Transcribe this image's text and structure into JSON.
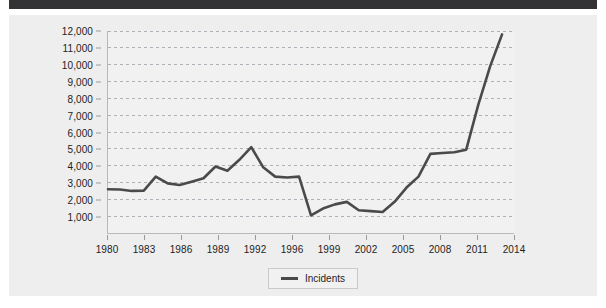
{
  "colors": {
    "top_band": "#333336",
    "figure_background": "#eeeeee",
    "plot_background": "#f1f1f1",
    "series_line": "#4a4a4a",
    "gridline": "#b0b0b8",
    "axis": "#b9b9b9",
    "text": "#1d1d1d"
  },
  "chart_data": {
    "type": "line",
    "title": "",
    "subtitle": "",
    "xlabel": "",
    "ylabel": "",
    "grid": "horizontal-dashed",
    "legend_position": "bottom-center",
    "xlim": [
      1980,
      2014
    ],
    "ylim": [
      0,
      12000
    ],
    "y_ticks": [
      1000,
      2000,
      3000,
      4000,
      5000,
      6000,
      7000,
      8000,
      9000,
      10000,
      11000,
      12000
    ],
    "y_tick_labels": [
      "1,000",
      "2,000",
      "3,000",
      "4,000",
      "5,000",
      "6,000",
      "7,000",
      "8,000",
      "9,000",
      "10,000",
      "11,000",
      "12,000"
    ],
    "x_tick_labels": [
      "1980",
      "1983",
      "1986",
      "1989",
      "1992",
      "1996",
      "1999",
      "2002",
      "2005",
      "2008",
      "2011",
      "2014"
    ],
    "x_tick_values": [
      1980,
      1983,
      1986,
      1989,
      1992,
      1996,
      1999,
      2002,
      2005,
      2008,
      2011,
      2014
    ],
    "legend": [
      "Incidents"
    ],
    "series": [
      {
        "name": "Incidents",
        "color": "#4a4a4a",
        "x": [
          1980,
          1981,
          1982,
          1983,
          1984,
          1985,
          1986,
          1987,
          1988,
          1989,
          1990,
          1991,
          1992,
          1993,
          1994,
          1995,
          1996,
          1997,
          1998,
          1999,
          2000,
          2001,
          2002,
          2003,
          2004,
          2005,
          2006,
          2007,
          2008,
          2009,
          2010,
          2011,
          2012,
          2013
        ],
        "values": [
          2600,
          2580,
          2500,
          2520,
          3350,
          2950,
          2850,
          3050,
          3250,
          3950,
          3700,
          4350,
          5100,
          3900,
          3350,
          3300,
          3350,
          1050,
          1450,
          1700,
          1850,
          1350,
          1300,
          1250,
          1850,
          2700,
          3350,
          4700,
          4750,
          4800,
          4950,
          7600,
          9900,
          11800
        ]
      }
    ]
  },
  "legend": {
    "incidents_label": "Incidents"
  }
}
